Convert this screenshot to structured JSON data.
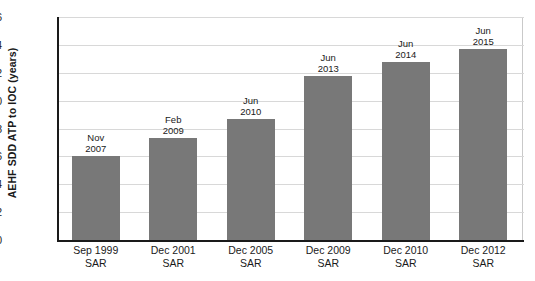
{
  "chart_data": {
    "type": "bar",
    "title": "",
    "xlabel": "",
    "ylabel": "AEHF SDD ATP to IOC (years)",
    "ylim": [
      0,
      16
    ],
    "ytick_step": 2,
    "yticks": [
      16,
      14,
      12,
      10,
      8,
      6,
      4,
      2,
      0
    ],
    "grid": true,
    "legend": "none",
    "categories": [
      "Sep 1999\nSAR",
      "Dec 2001\nSAR",
      "Dec 2005\nSAR",
      "Dec 2009\nSAR",
      "Dec 2010\nSAR",
      "Dec 2012\nSAR"
    ],
    "category_lines": [
      {
        "line1": "Sep 1999",
        "line2": "SAR"
      },
      {
        "line1": "Dec 2001",
        "line2": "SAR"
      },
      {
        "line1": "Dec 2005",
        "line2": "SAR"
      },
      {
        "line1": "Dec 2009",
        "line2": "SAR"
      },
      {
        "line1": "Dec 2010",
        "line2": "SAR"
      },
      {
        "line1": "Dec 2012",
        "line2": "SAR"
      }
    ],
    "values": [
      6.0,
      7.3,
      8.7,
      11.8,
      12.8,
      13.7
    ],
    "bar_labels": [
      {
        "line1": "Nov",
        "line2": "2007"
      },
      {
        "line1": "Feb",
        "line2": "2009"
      },
      {
        "line1": "Jun",
        "line2": "2010"
      },
      {
        "line1": "Jun",
        "line2": "2013"
      },
      {
        "line1": "Jun",
        "line2": "2014"
      },
      {
        "line1": "Jun",
        "line2": "2015"
      }
    ],
    "bar_color": "#787878",
    "axis_color": "#1a1a1a",
    "grid_color": "#d8d8d8",
    "background": "#ffffff"
  }
}
